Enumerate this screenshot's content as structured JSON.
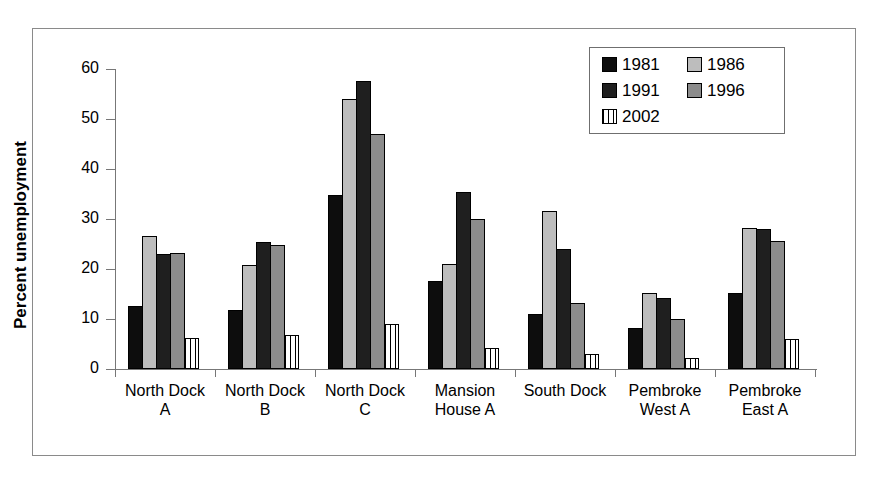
{
  "chart_data": {
    "type": "bar",
    "title": "",
    "xlabel": "",
    "ylabel": "Percent unemployment",
    "ylim": [
      0,
      60
    ],
    "yticks": [
      0,
      10,
      20,
      30,
      40,
      50,
      60
    ],
    "grid": false,
    "legend_position": "top-right",
    "categories": [
      "North Dock A",
      "North Dock B",
      "North Dock C",
      "Mansion House A",
      "South Dock",
      "Pembroke West A",
      "Pembroke East A"
    ],
    "category_lines": [
      [
        "North Dock",
        "A"
      ],
      [
        "North Dock",
        "B"
      ],
      [
        "North Dock",
        "C"
      ],
      [
        "Mansion",
        "House A"
      ],
      [
        "South Dock",
        ""
      ],
      [
        "Pembroke",
        "West A"
      ],
      [
        "Pembroke",
        "East A"
      ]
    ],
    "series": [
      {
        "name": "1981",
        "fill": "solid-black",
        "color": "#0d0d0d",
        "values": [
          12.6,
          11.8,
          34.9,
          17.7,
          11.0,
          8.3,
          15.2
        ]
      },
      {
        "name": "1986",
        "fill": "light-gray",
        "color": "#bdbdbd",
        "values": [
          26.6,
          20.9,
          54.0,
          21.0,
          31.7,
          15.3,
          28.3
        ]
      },
      {
        "name": "1991",
        "fill": "dark-gray",
        "color": "#1f1f1f",
        "values": [
          23.0,
          25.5,
          57.7,
          35.5,
          24.0,
          14.3,
          28.0
        ]
      },
      {
        "name": "1996",
        "fill": "medium-gray",
        "color": "#8c8c8c",
        "values": [
          23.3,
          24.8,
          47.0,
          30.0,
          13.3,
          10.0,
          25.7
        ]
      },
      {
        "name": "2002",
        "fill": "vertical-stripes",
        "color": "#ffffff",
        "values": [
          6.2,
          6.9,
          9.1,
          4.3,
          3.1,
          2.3,
          6.0
        ]
      }
    ]
  },
  "legend": {
    "entries": [
      "1981",
      "1986",
      "1991",
      "1996",
      "2002"
    ]
  },
  "axis": {
    "y_title": "Percent unemployment",
    "y_tick_labels": [
      "60",
      "50",
      "40",
      "30",
      "20",
      "10",
      "0"
    ]
  }
}
